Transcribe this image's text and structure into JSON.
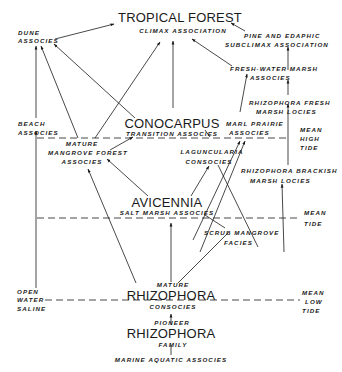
{
  "diagram": {
    "nodes": {
      "tropical_forest": "TROPICAL FOREST",
      "climax_association": "CLIMAX  ASSOCIATION",
      "pine_line1": "PINE  AND  EDAPHIC",
      "pine_line2": "SUBCLIMAX  ASSOCIATION",
      "dune_line1": "DUNE",
      "dune_line2": "ASSOCIES",
      "freshwater_line1": "FRESH-WATER  MARSH",
      "freshwater_line2": "ASSOCIES",
      "rhizo_fresh_line1": "RHIZOPHORA  FRESH",
      "rhizo_fresh_line2": "MARSH  LOCIES",
      "beach_line1": "BEACH",
      "beach_line2": "ASSOCIES",
      "conocarpus": "CONOCARPUS",
      "conocarpus_sub": "TRANSITION  ASSOCIES",
      "marl_line1": "MARL  PRAIRIE",
      "marl_line2": "ASSOCIES",
      "mature_mangrove_line1": "MATURE",
      "mature_mangrove_line2": "MANGROVE  FOREST",
      "mature_mangrove_line3": "ASSOCIES",
      "laguncularia_line1": "LAGUNCULARIA",
      "laguncularia_line2": "CONSOCIES",
      "rhizo_brackish_line1": "RHIZOPHORA  BRACKISH",
      "rhizo_brackish_line2": "MARSH  LOCIES",
      "avicennia": "AVICENNIA",
      "avicennia_sub": "SALT  MARSH  ASSOCIES",
      "scrub_line1": "SCRUB  MANGROVE",
      "scrub_line2": "FACIES",
      "open_line1": "OPEN",
      "open_line2": "WATER",
      "open_line3": "SALINE",
      "mature_rhizo_pre": "MATURE",
      "mature_rhizo": "RHIZOPHORA",
      "mature_rhizo_sub": "CONSOCIES",
      "pioneer_pre": "PIONEER",
      "pioneer_rhizo": "RHIZOPHORA",
      "pioneer_sub": "FAMILY",
      "marine": "MARINE  AQUATIC  ASSOCIES"
    },
    "tide_levels": {
      "mean_high_tide": [
        "MEAN",
        "HIGH",
        "TIDE"
      ],
      "mean_tide": [
        "MEAN",
        "TIDE"
      ],
      "mean_low_tide": [
        "MEAN",
        "LOW",
        "TIDE"
      ]
    },
    "colors": {
      "ink": "#1a1a1a",
      "background": "#ffffff"
    }
  }
}
